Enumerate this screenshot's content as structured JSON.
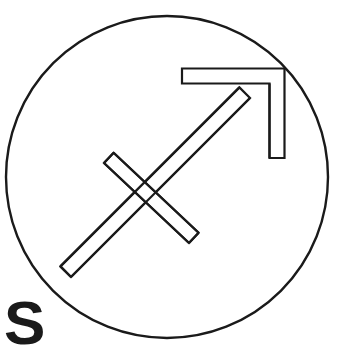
{
  "figure": {
    "type": "line-drawing",
    "background_color": "#ffffff",
    "stroke_color": "#1a1a1a",
    "fill_color": "#ffffff",
    "canvas": {
      "width": 340,
      "height": 356
    }
  },
  "circle": {
    "name": "outer-circle",
    "center_x": 167,
    "center_y": 177,
    "radius": 161,
    "stroke_width": 2.4,
    "fill": "none"
  },
  "glyph": {
    "name": "sagittarius-arrow",
    "description": "Outlined arrow pointing up-right crossed by a diagonal bar",
    "stroke_width": 2.2,
    "shaft": {
      "name": "arrow-shaft",
      "tail_x": 71,
      "tail_y": 277,
      "head_x": 250,
      "head_y": 98,
      "thickness": 15
    },
    "arrowhead": {
      "name": "arrow-head",
      "corner_x": 277,
      "corner_y": 76,
      "left_end_x": 182,
      "left_end_y": 76,
      "bottom_end_x": 277,
      "bottom_end_y": 158,
      "thickness": 15
    },
    "crossbar": {
      "name": "cross-bar",
      "start_x": 104,
      "start_y": 163,
      "end_x": 189,
      "end_y": 243,
      "thickness": 14
    }
  },
  "caption": {
    "label": "S",
    "color": "#1a1a1a",
    "x": 4,
    "y": 300
  }
}
